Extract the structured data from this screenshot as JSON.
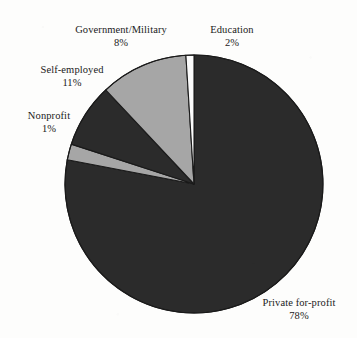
{
  "chart_data": {
    "type": "pie",
    "title": "",
    "subtitle": "",
    "xlabel": "",
    "ylabel": "",
    "legend_position": "none",
    "grid": false,
    "labels_show_percent": true,
    "start_angle_deg": 0,
    "direction": "clockwise",
    "categories": [
      "Private for-profit",
      "Education",
      "Government/Military",
      "Self-employed",
      "Nonprofit"
    ],
    "values": [
      78,
      2,
      8,
      11,
      1
    ],
    "slices": [
      {
        "name": "Private for-profit",
        "percent": 78,
        "label": "Private for-profit",
        "percent_text": "78%",
        "color": "#2b2b2b"
      },
      {
        "name": "Education",
        "percent": 2,
        "label": "Education",
        "percent_text": "2%",
        "color": "#a6a6a6"
      },
      {
        "name": "Government/Military",
        "percent": 8,
        "label": "Government/Military",
        "percent_text": "8%",
        "color": "#2b2b2b"
      },
      {
        "name": "Self-employed",
        "percent": 11,
        "label": "Self-employed",
        "percent_text": "11%",
        "color": "#a6a6a6"
      },
      {
        "name": "Nonprofit",
        "percent": 1,
        "label": "Nonprofit",
        "percent_text": "1%",
        "color": "#fbfbfb"
      }
    ],
    "colors": {
      "dark": "#2b2b2b",
      "gray": "#a6a6a6",
      "light": "#fbfbfb",
      "outline": "#1a1a1a",
      "background": "#fdfdfc",
      "text": "#1a1a1a"
    },
    "geometry": {
      "center_x": 194,
      "center_y": 184,
      "radius": 129
    }
  }
}
